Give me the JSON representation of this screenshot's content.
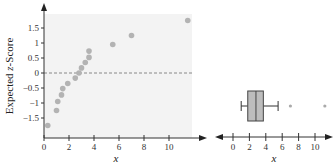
{
  "chart_data": [
    {
      "type": "scatter",
      "title": "",
      "xlabel": "x",
      "ylabel": "Expected z-Score",
      "xlim": [
        0,
        12
      ],
      "ylim": [
        -2,
        2
      ],
      "x_ticks": [
        0,
        2,
        4,
        6,
        8,
        10
      ],
      "y_ticks": [
        -1.5,
        -1,
        -0.5,
        0,
        0.5,
        1,
        1.5
      ],
      "y_tick_labels": [
        "−1.5",
        "−1",
        "−0.5",
        "0",
        "0.5",
        "1",
        "1.5"
      ],
      "reference_line": {
        "y": 0,
        "style": "dashed"
      },
      "grid": false,
      "background": "#f3f3f3",
      "point_color": "#b3b3b3",
      "series": [
        {
          "name": "normal probability plot",
          "points": [
            {
              "x": 0.3,
              "y": -1.75
            },
            {
              "x": 1.0,
              "y": -1.25
            },
            {
              "x": 1.1,
              "y": -0.95
            },
            {
              "x": 1.4,
              "y": -0.73
            },
            {
              "x": 1.5,
              "y": -0.52
            },
            {
              "x": 1.9,
              "y": -0.35
            },
            {
              "x": 2.5,
              "y": -0.17
            },
            {
              "x": 2.8,
              "y": 0.0
            },
            {
              "x": 3.0,
              "y": 0.17
            },
            {
              "x": 3.3,
              "y": 0.35
            },
            {
              "x": 3.6,
              "y": 0.52
            },
            {
              "x": 3.6,
              "y": 0.73
            },
            {
              "x": 5.5,
              "y": 0.95
            },
            {
              "x": 7.0,
              "y": 1.25
            },
            {
              "x": 11.5,
              "y": 1.75
            }
          ]
        }
      ]
    },
    {
      "type": "boxplot",
      "title": "",
      "xlabel": "x",
      "xlim": [
        -1,
        12
      ],
      "x_ticks": [
        0,
        2,
        4,
        6,
        8,
        10
      ],
      "box_color": "#bdbdbd",
      "whisker_low": 1.0,
      "q1": 1.8,
      "median": 2.8,
      "q3": 3.7,
      "whisker_high": 5.5,
      "outliers": [
        7.0,
        11.2
      ]
    }
  ]
}
